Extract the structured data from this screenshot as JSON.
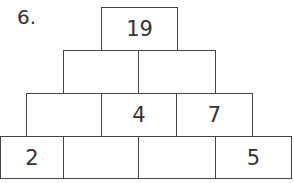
{
  "problem_number": "6.",
  "pyramid": {
    "rows": [
      [
        "19"
      ],
      [
        "",
        ""
      ],
      [
        "",
        "4",
        "7"
      ],
      [
        "2",
        "",
        "",
        "5"
      ]
    ]
  },
  "colors": {
    "border": "#444444",
    "text": "#333333",
    "background": "#ffffff"
  }
}
